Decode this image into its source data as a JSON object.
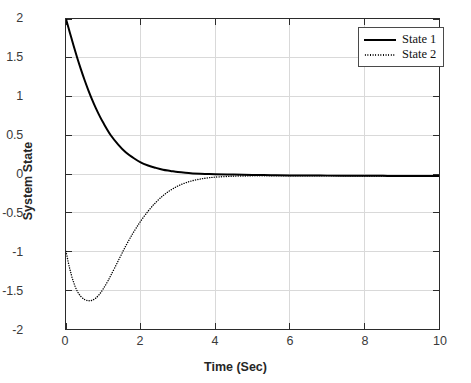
{
  "chart_data": {
    "type": "line",
    "title": "",
    "xlabel": "Time (Sec)",
    "ylabel": "System State",
    "xlim": [
      0,
      10
    ],
    "ylim": [
      -2,
      2
    ],
    "xticks": [
      "0",
      "2",
      "4",
      "6",
      "8",
      "10"
    ],
    "xtick_values": [
      0,
      2,
      4,
      6,
      8,
      10
    ],
    "yticks": [
      "2",
      "1.5",
      "1",
      "0.5",
      "0",
      "-0.5",
      "-1",
      "-1.5",
      "-2"
    ],
    "ytick_values": [
      2,
      1.5,
      1,
      0.5,
      0,
      -0.5,
      -1,
      -1.5,
      -2
    ],
    "grid": true,
    "legend_position": "top-right",
    "background_color": "#ffffff",
    "axis_color": "#2b2b2b",
    "grid_color": "#d9d9d9",
    "series": [
      {
        "name": "State 1",
        "style": "solid",
        "color": "#000000",
        "linewidth": 2.0,
        "x": [
          0,
          0.1,
          0.2,
          0.3,
          0.4,
          0.5,
          0.6,
          0.7,
          0.8,
          0.9,
          1.0,
          1.2,
          1.4,
          1.6,
          1.8,
          2.0,
          2.2,
          2.4,
          2.6,
          2.8,
          3.0,
          3.2,
          3.4,
          3.6,
          3.8,
          4.0,
          4.5,
          5.0,
          5.5,
          6.0,
          6.5,
          7.0,
          7.5,
          8.0,
          8.5,
          9.0,
          9.5,
          10.0
        ],
        "values": [
          2.0,
          1.83,
          1.66,
          1.5,
          1.35,
          1.21,
          1.08,
          0.96,
          0.85,
          0.75,
          0.66,
          0.5,
          0.38,
          0.28,
          0.21,
          0.15,
          0.11,
          0.08,
          0.055,
          0.04,
          0.025,
          0.015,
          0.008,
          0.003,
          0.0,
          -0.003,
          -0.008,
          -0.012,
          -0.015,
          -0.018,
          -0.02,
          -0.021,
          -0.022,
          -0.023,
          -0.024,
          -0.025,
          -0.025,
          -0.026
        ]
      },
      {
        "name": "State 2",
        "style": "dotted",
        "color": "#000000",
        "linewidth": 1.4,
        "x": [
          0,
          0.1,
          0.2,
          0.3,
          0.4,
          0.5,
          0.6,
          0.7,
          0.8,
          0.9,
          1.0,
          1.1,
          1.2,
          1.4,
          1.6,
          1.8,
          2.0,
          2.2,
          2.4,
          2.6,
          2.8,
          3.0,
          3.2,
          3.4,
          3.6,
          3.8,
          4.0,
          4.5,
          5.0,
          5.5,
          6.0,
          6.5,
          7.0,
          7.5,
          8.0,
          8.5,
          9.0,
          9.5,
          10.0
        ],
        "values": [
          -1.0,
          -1.22,
          -1.39,
          -1.51,
          -1.58,
          -1.62,
          -1.635,
          -1.63,
          -1.6,
          -1.55,
          -1.48,
          -1.4,
          -1.31,
          -1.12,
          -0.93,
          -0.76,
          -0.61,
          -0.48,
          -0.37,
          -0.28,
          -0.21,
          -0.155,
          -0.115,
          -0.085,
          -0.065,
          -0.05,
          -0.04,
          -0.028,
          -0.024,
          -0.023,
          -0.023,
          -0.023,
          -0.024,
          -0.024,
          -0.025,
          -0.025,
          -0.026,
          -0.026,
          -0.026
        ]
      }
    ],
    "annotations": {
      "state2_minimum_value": -1.635,
      "state2_minimum_time": 0.65,
      "state1_initial_value": 2.0,
      "state2_initial_value": -1.0
    }
  },
  "legend": {
    "entries": [
      {
        "label": "State 1",
        "style": "solid"
      },
      {
        "label": "State 2",
        "style": "dotted"
      }
    ]
  }
}
